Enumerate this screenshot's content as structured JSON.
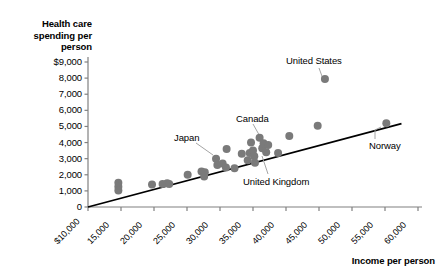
{
  "chart_data": {
    "type": "scatter",
    "title": "",
    "xlabel": "Income per person",
    "ylabel": "Health care spending per person",
    "xlim": [
      10000,
      60000
    ],
    "ylim": [
      0,
      9000
    ],
    "grid": false,
    "legend": null,
    "x_ticks": [
      "$10,000",
      "15,000",
      "20,000",
      "25,000",
      "30,000",
      "35,000",
      "40,000",
      "45,000",
      "50,000",
      "55,000",
      "60,000"
    ],
    "x_tick_values": [
      10000,
      15000,
      20000,
      25000,
      30000,
      35000,
      40000,
      45000,
      50000,
      55000,
      60000
    ],
    "y_ticks": [
      "0",
      "1,000",
      "2,000",
      "3,000",
      "4,000",
      "5,000",
      "6,000",
      "7,000",
      "8,000",
      "$9,000"
    ],
    "y_tick_values": [
      0,
      1000,
      2000,
      3000,
      4000,
      5000,
      6000,
      7000,
      8000,
      9000
    ],
    "point_color": "#7a7a7a",
    "line_color": "#000000",
    "axis_color": "#808080",
    "trendline": {
      "x": [
        10000,
        57500
      ],
      "y": [
        0,
        5180
      ]
    },
    "points": [
      {
        "x": 14600,
        "y": 1500
      },
      {
        "x": 14600,
        "y": 1250
      },
      {
        "x": 14600,
        "y": 1020
      },
      {
        "x": 19700,
        "y": 1400
      },
      {
        "x": 21300,
        "y": 1430
      },
      {
        "x": 22000,
        "y": 1480
      },
      {
        "x": 22300,
        "y": 1420
      },
      {
        "x": 25100,
        "y": 2000
      },
      {
        "x": 27200,
        "y": 2200
      },
      {
        "x": 27600,
        "y": 1900
      },
      {
        "x": 27700,
        "y": 2150
      },
      {
        "x": 29400,
        "y": 3000
      },
      {
        "x": 29600,
        "y": 2600
      },
      {
        "x": 30400,
        "y": 2700
      },
      {
        "x": 30900,
        "y": 2450
      },
      {
        "x": 31000,
        "y": 3600
      },
      {
        "x": 32200,
        "y": 2400
      },
      {
        "x": 33300,
        "y": 3300
      },
      {
        "x": 34200,
        "y": 2900
      },
      {
        "x": 34500,
        "y": 3350
      },
      {
        "x": 34700,
        "y": 4000
      },
      {
        "x": 35000,
        "y": 3500
      },
      {
        "x": 35200,
        "y": 3150
      },
      {
        "x": 35300,
        "y": 2750
      },
      {
        "x": 36000,
        "y": 4300
      },
      {
        "x": 36400,
        "y": 3650
      },
      {
        "x": 36600,
        "y": 3950
      },
      {
        "x": 37000,
        "y": 3400
      },
      {
        "x": 37300,
        "y": 3850
      },
      {
        "x": 38800,
        "y": 3350
      },
      {
        "x": 40500,
        "y": 4400
      },
      {
        "x": 44800,
        "y": 5050
      },
      {
        "x": 45900,
        "y": 7950
      },
      {
        "x": 55200,
        "y": 5200
      }
    ],
    "annotations": [
      {
        "label": "United States",
        "text_x": 286,
        "text_y": 55,
        "leader": [
          [
            319,
            68
          ],
          [
            323,
            79
          ]
        ],
        "point_index": 32
      },
      {
        "label": "Canada",
        "text_x": 236,
        "text_y": 113,
        "leader": [
          [
            253,
            124
          ],
          [
            262,
            140
          ]
        ],
        "point_index": 26
      },
      {
        "label": "Japan",
        "text_x": 174,
        "text_y": 132,
        "leader": [
          [
            196,
            143
          ],
          [
            213,
            155
          ]
        ],
        "point_index": 19
      },
      {
        "label": "United Kingdom",
        "text_x": 243,
        "text_y": 176,
        "leader": [
          [
            268,
            174
          ],
          [
            262,
            156
          ]
        ],
        "point_index": 23
      },
      {
        "label": "Norway",
        "text_x": 369,
        "text_y": 140,
        "leader": [
          [
            375,
            139
          ],
          [
            375,
            130
          ],
          [
            381,
            127
          ]
        ],
        "point_index": 33
      }
    ]
  }
}
